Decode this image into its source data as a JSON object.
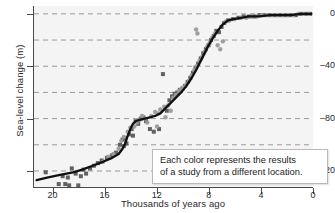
{
  "chart_data": {
    "type": "scatter",
    "title": "",
    "xlabel": "Thousands of years ago",
    "ylabel": "Sea-level change (m)",
    "xlim": [
      21.5,
      0
    ],
    "ylim": [
      -133,
      6
    ],
    "x_ticks": [
      20,
      16,
      12,
      8,
      4,
      0
    ],
    "y_ticks": [
      0,
      -40,
      -80,
      -120
    ],
    "gridlines_y": [
      0,
      -20,
      -40,
      -60,
      -80,
      -100,
      -120
    ],
    "x_axis_reversed": true,
    "grid": "horizontal-dashed",
    "legend": "none",
    "annotation": {
      "line1": "Each color represents the results",
      "line2": "of a study from a different location."
    },
    "colors": {
      "plot_background": "#f4f4f4",
      "axis": "#4a4a4a",
      "gridline": "#9a9aa0",
      "trend_line": "#111111",
      "series_dark": "#585858",
      "series_light": "#9b9b9b",
      "annotation_background": "#ffffff",
      "annotation_border": "#b9b9b9",
      "text": "#2a2a2a"
    },
    "series": [
      {
        "name": "study-dark-squares",
        "marker": "square",
        "color": "#585858",
        "points": [
          [
            20.6,
            -121
          ],
          [
            19.6,
            -130
          ],
          [
            19.3,
            -124
          ],
          [
            19.1,
            -130
          ],
          [
            18.9,
            -125
          ],
          [
            18.8,
            -131
          ],
          [
            18.6,
            -118
          ],
          [
            18.3,
            -122
          ],
          [
            18.1,
            -131
          ],
          [
            17.9,
            -124
          ],
          [
            17.7,
            -119
          ],
          [
            17.5,
            -122
          ],
          [
            17.2,
            -118
          ],
          [
            16.9,
            -116
          ],
          [
            16.6,
            -114
          ],
          [
            16.3,
            -112
          ],
          [
            15.9,
            -110
          ],
          [
            15.5,
            -108
          ],
          [
            15.2,
            -106
          ],
          [
            14.9,
            -100
          ],
          [
            14.7,
            -96
          ],
          [
            14.6,
            -101
          ],
          [
            14.5,
            -95
          ],
          [
            14.4,
            -99
          ],
          [
            14.2,
            -92
          ],
          [
            14.0,
            -88
          ],
          [
            13.9,
            -93
          ],
          [
            13.7,
            -82
          ],
          [
            13.5,
            -84
          ],
          [
            13.3,
            -80
          ],
          [
            13.1,
            -79
          ],
          [
            12.9,
            -82
          ],
          [
            12.6,
            -88
          ],
          [
            12.3,
            -90
          ],
          [
            11.9,
            -88
          ],
          [
            11.6,
            -46
          ],
          [
            11.3,
            -74
          ],
          [
            11.1,
            -66
          ],
          [
            10.9,
            -63
          ],
          [
            10.7,
            -61
          ],
          [
            10.5,
            -60
          ],
          [
            10.3,
            -58
          ],
          [
            10.1,
            -57
          ],
          [
            9.9,
            -55
          ],
          [
            9.7,
            -52
          ],
          [
            9.5,
            -49
          ],
          [
            9.3,
            -45
          ],
          [
            9.1,
            -41
          ],
          [
            8.9,
            -38
          ],
          [
            8.7,
            -34
          ],
          [
            8.5,
            -30
          ],
          [
            8.3,
            -27
          ],
          [
            8.1,
            -24
          ],
          [
            7.9,
            -20
          ],
          [
            7.7,
            -17
          ],
          [
            7.5,
            -13
          ],
          [
            7.3,
            -14
          ],
          [
            7.1,
            -10
          ],
          [
            6.9,
            -7
          ],
          [
            6.6,
            -5
          ],
          [
            6.2,
            -4
          ],
          [
            5.8,
            -3
          ],
          [
            5.4,
            -2
          ],
          [
            5.0,
            -2
          ],
          [
            4.6,
            -2
          ],
          [
            4.2,
            -1
          ],
          [
            3.8,
            -1
          ],
          [
            3.4,
            -1
          ],
          [
            3.0,
            -1
          ],
          [
            2.6,
            -1
          ],
          [
            2.2,
            -1
          ],
          [
            1.8,
            -1
          ],
          [
            1.4,
            -1
          ],
          [
            1.0,
            0
          ],
          [
            0.6,
            0
          ],
          [
            0.3,
            0
          ]
        ]
      },
      {
        "name": "study-light-circles",
        "marker": "circle",
        "color": "#9b9b9b",
        "points": [
          [
            16.2,
            -113
          ],
          [
            15.8,
            -109
          ],
          [
            15.4,
            -107
          ],
          [
            15.0,
            -103
          ],
          [
            14.8,
            -97
          ],
          [
            14.6,
            -94
          ],
          [
            14.3,
            -90
          ],
          [
            14.1,
            -87
          ],
          [
            13.8,
            -86
          ],
          [
            13.6,
            -83
          ],
          [
            13.4,
            -81
          ],
          [
            13.2,
            -78
          ],
          [
            13.0,
            -80
          ],
          [
            12.8,
            -83
          ],
          [
            12.5,
            -78
          ],
          [
            12.2,
            -75
          ],
          [
            12.0,
            -76
          ],
          [
            11.8,
            -73
          ],
          [
            11.5,
            -71
          ],
          [
            11.2,
            -70
          ],
          [
            11.0,
            -74
          ],
          [
            10.8,
            -64
          ],
          [
            10.6,
            -62
          ],
          [
            10.4,
            -59
          ],
          [
            10.2,
            -58
          ],
          [
            10.0,
            -56
          ],
          [
            9.8,
            -54
          ],
          [
            9.6,
            -51
          ],
          [
            9.4,
            -47
          ],
          [
            9.2,
            -43
          ],
          [
            9.0,
            -40
          ],
          [
            8.8,
            -36
          ],
          [
            8.6,
            -33
          ],
          [
            8.4,
            -29
          ],
          [
            8.2,
            -25
          ],
          [
            8.0,
            -22
          ],
          [
            7.8,
            -18
          ],
          [
            7.6,
            -15
          ],
          [
            7.4,
            -24
          ],
          [
            7.2,
            -27
          ],
          [
            7.0,
            -21
          ],
          [
            6.8,
            -6
          ],
          [
            6.5,
            -5
          ],
          [
            6.1,
            -4
          ],
          [
            5.6,
            -3
          ],
          [
            5.2,
            -3
          ],
          [
            4.8,
            -2
          ],
          [
            4.4,
            -2
          ],
          [
            4.0,
            -1
          ],
          [
            3.6,
            -1
          ],
          [
            3.2,
            -1
          ],
          [
            2.8,
            -1
          ],
          [
            2.4,
            -1
          ],
          [
            2.0,
            -1
          ],
          [
            1.6,
            -1
          ],
          [
            1.2,
            0
          ],
          [
            0.8,
            0
          ],
          [
            0.4,
            0
          ],
          [
            9.05,
            -12
          ],
          [
            8.95,
            -15
          ],
          [
            12.05,
            -86
          ],
          [
            11.4,
            -79
          ]
        ]
      }
    ],
    "trend_line": {
      "name": "fitted-sea-level-curve",
      "points": [
        [
          21.3,
          -127
        ],
        [
          20.5,
          -125
        ],
        [
          19.5,
          -123
        ],
        [
          18.5,
          -121
        ],
        [
          17.8,
          -119
        ],
        [
          17.0,
          -116
        ],
        [
          16.2,
          -113
        ],
        [
          15.5,
          -110
        ],
        [
          15.0,
          -107
        ],
        [
          14.7,
          -103
        ],
        [
          14.5,
          -99
        ],
        [
          14.3,
          -93
        ],
        [
          14.1,
          -88
        ],
        [
          13.9,
          -84
        ],
        [
          13.7,
          -82
        ],
        [
          13.4,
          -81
        ],
        [
          13.0,
          -80
        ],
        [
          12.6,
          -79
        ],
        [
          12.2,
          -78
        ],
        [
          11.8,
          -76
        ],
        [
          11.4,
          -72
        ],
        [
          11.0,
          -68
        ],
        [
          10.6,
          -64
        ],
        [
          10.2,
          -60
        ],
        [
          9.8,
          -55
        ],
        [
          9.4,
          -49
        ],
        [
          9.0,
          -42
        ],
        [
          8.6,
          -34
        ],
        [
          8.2,
          -26
        ],
        [
          7.8,
          -19
        ],
        [
          7.4,
          -13
        ],
        [
          7.0,
          -8
        ],
        [
          6.6,
          -5
        ],
        [
          6.2,
          -4
        ],
        [
          5.6,
          -3
        ],
        [
          5.0,
          -2
        ],
        [
          4.2,
          -2
        ],
        [
          3.4,
          -1
        ],
        [
          2.6,
          -1
        ],
        [
          1.8,
          -1
        ],
        [
          1.0,
          0
        ],
        [
          0.2,
          0
        ]
      ]
    }
  }
}
